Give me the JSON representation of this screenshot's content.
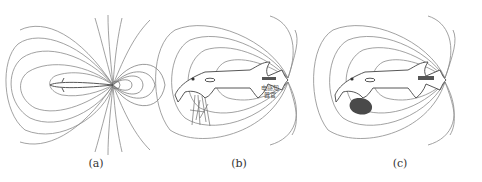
{
  "figure": {
    "panels": [
      {
        "id": "a",
        "caption": "(a)",
        "description": "dipole electric field lines around fish (top view)"
      },
      {
        "id": "b",
        "caption": "(b)",
        "description": "field lines around electric fish with plants nearby",
        "label_line1": "电感知",
        "label_line2": "器官"
      },
      {
        "id": "c",
        "caption": "(c)",
        "description": "field lines distorted by a dark object (stone)"
      }
    ],
    "colors": {
      "field_line": "#8a8a8a",
      "fish_outline": "#444444",
      "object": "#4a4a4a"
    }
  }
}
